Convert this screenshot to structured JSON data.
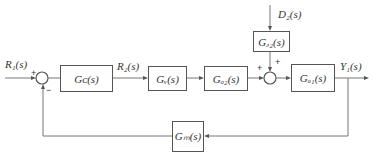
{
  "diagram": {
    "type": "feedback control block diagram",
    "signals": {
      "input": "R₁(s)",
      "intermediate": "R₂(s)",
      "disturbance": "D₂(s)",
      "output": "Y₁(s)"
    },
    "blocks": {
      "controller": "Gᴄ(s)",
      "valve": "Gᵥ(s)",
      "process2": "Gₒ₂(s)",
      "disturbance": "Gₔ₂(s)",
      "process1": "Gₒ₁(s)",
      "measurement": "Gₘ(s)"
    },
    "junctions": {
      "sum1": {
        "signs": [
          "+",
          "−"
        ]
      },
      "sum2": {
        "signs": [
          "+",
          "+"
        ]
      }
    }
  }
}
